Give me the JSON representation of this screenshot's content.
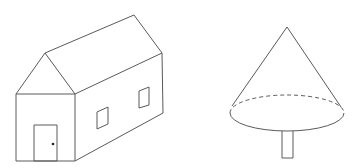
{
  "canvas": {
    "width": 355,
    "height": 168,
    "background": "#ffffff",
    "stroke_color": "#5a5a5a"
  },
  "figures": [
    {
      "name": "house",
      "description": "3D line drawing of a house with gabled roof, front door with knob, two side windows",
      "front_wall": {
        "x": 16,
        "y": 94,
        "width": 59,
        "height": 67
      },
      "gable_apex": [
        45,
        53
      ],
      "ridge_back": [
        134,
        15
      ],
      "back_top_right": [
        162,
        53
      ],
      "back_bottom_right": [
        163,
        113
      ],
      "door": {
        "x": 34,
        "y": 125,
        "width": 23,
        "height": 36,
        "knob": [
          53,
          144
        ]
      },
      "windows": [
        {
          "points": [
            [
              97,
              112
            ],
            [
              108,
              107
            ],
            [
              108,
              124
            ],
            [
              97,
              129
            ]
          ]
        },
        {
          "points": [
            [
              139,
              91
            ],
            [
              149,
              87
            ],
            [
              149,
              105
            ],
            [
              139,
              108
            ]
          ]
        }
      ]
    },
    {
      "name": "tree",
      "description": "Cone-shaped tree with elliptical base (dashed back edge) and rectangular trunk",
      "apex": [
        287,
        27
      ],
      "base_ellipse": {
        "cx": 287,
        "cy": 113,
        "rx": 57,
        "ry": 18
      },
      "trunk": {
        "x": 282,
        "y": 131,
        "width": 11,
        "height": 27
      }
    }
  ]
}
